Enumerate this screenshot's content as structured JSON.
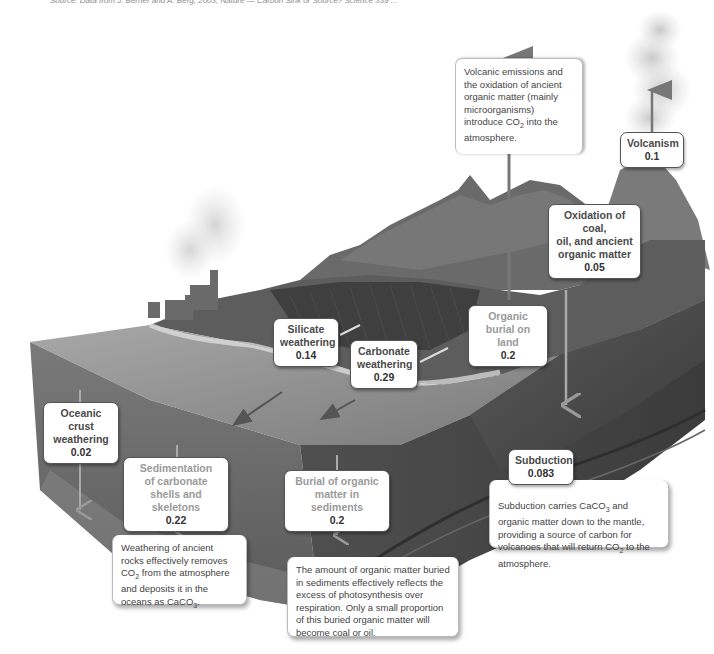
{
  "credit_line": "Source: Data from J. Berner and A. Berg, 2003; Nature — Carbon Sink or Source? Science 339 ...",
  "colors": {
    "background": "#ffffff",
    "label_border": "#555555",
    "label_text": "#4a4a4a",
    "label_text_dim": "#9a9a9a",
    "ocean_surface": "#8c8c8c",
    "ocean_block": "#6e6e6e",
    "rock": "#4a4a4a",
    "arrow_up": "#777777"
  },
  "fluxes": {
    "volcanism": {
      "label": "Volcanism",
      "value": "0.1"
    },
    "oxidation": {
      "label_lines": [
        "Oxidation of coal,",
        "oil, and ancient",
        "organic matter"
      ],
      "value": "0.05"
    },
    "silicate": {
      "label_lines": [
        "Silicate",
        "weathering"
      ],
      "value": "0.14"
    },
    "carbonate": {
      "label_lines": [
        "Carbonate",
        "weathering"
      ],
      "value": "0.29"
    },
    "organic_land": {
      "label_lines": [
        "Organic",
        "burial on land"
      ],
      "value": "0.2"
    },
    "oceanic_crust": {
      "label_lines": [
        "Oceanic crust",
        "weathering"
      ],
      "value": "0.02"
    },
    "sedimentation": {
      "label_lines": [
        "Sedimentation",
        "of carbonate",
        "shells and skeletons"
      ],
      "value": "0.22"
    },
    "burial_sediments": {
      "label_lines": [
        "Burial of organic",
        "matter in sediments"
      ],
      "value": "0.2"
    },
    "subduction": {
      "label": "Subduction",
      "value": "0.083"
    }
  },
  "notes": {
    "volcanic": {
      "pre": "Volcanic emissions and the oxidation of ancient organic matter (mainly microorganisms) introduce CO",
      "sub": "2",
      "post": " into the atmosphere."
    },
    "weathering": {
      "pre": "Weathering of ancient rocks effectively removes CO",
      "sub": "2",
      "mid": " from the atmosphere and deposits it in the oceans as CaCO",
      "sub2": "3",
      "post": "."
    },
    "burial": {
      "text": "The amount of organic matter buried in sediments effectively reflects the excess of photosynthesis over respiration. Only a small proportion of this buried organic matter will become coal or oil."
    },
    "subduction": {
      "pre": "Subduction carries CaCO",
      "sub": "3",
      "mid": " and organic matter down to the mantle, providing a source of carbon for volcanoes that will return CO",
      "sub2": "2",
      "post": " to the atmosphere."
    }
  }
}
